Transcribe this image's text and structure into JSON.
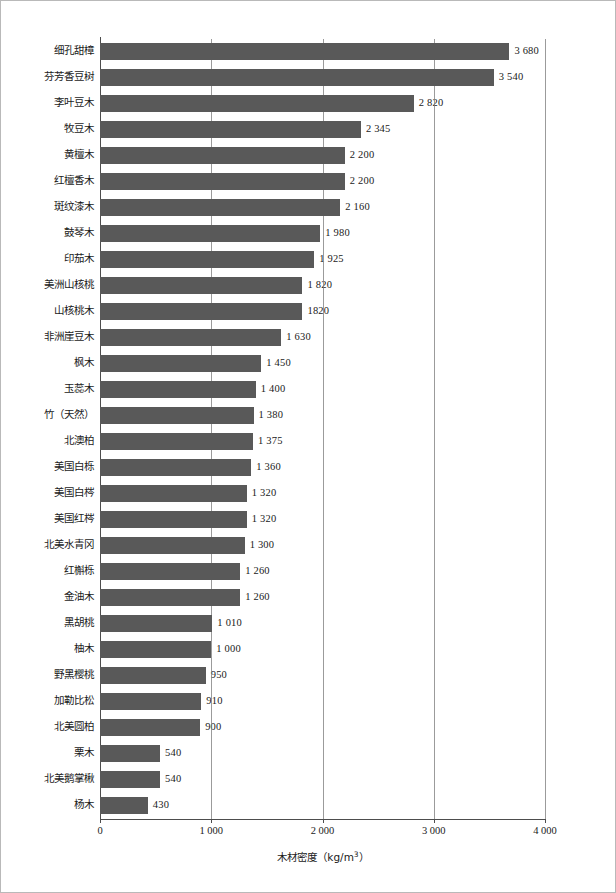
{
  "chart_data": {
    "type": "bar",
    "orientation": "horizontal",
    "title": "",
    "xlabel": "木材密度（kg/m³）",
    "ylabel": "",
    "xlim": [
      0,
      4000
    ],
    "grid": true,
    "legend": null,
    "xticks": [
      "0",
      "1 000",
      "2 000",
      "3 000",
      "4 000"
    ],
    "xtick_values": [
      0,
      1000,
      2000,
      3000,
      4000
    ],
    "bar_color": "#595959",
    "categories": [
      "细孔甜樟",
      "芬芳香豆树",
      "李叶豆木",
      "牧豆木",
      "黄檀木",
      "红檀香木",
      "斑纹漆木",
      "鼓琴木",
      "印茄木",
      "美洲山核桃",
      "山核桃木",
      "非洲崖豆木",
      "枫木",
      "玉蕊木",
      "竹（天然）",
      "北澳柏",
      "美国白栎",
      "美国白梣",
      "美国红梣",
      "北美水青冈",
      "红槲栎",
      "金油木",
      "黑胡桃",
      "柚木",
      "野黑樱桃",
      "加勒比松",
      "北美圆柏",
      "栗木",
      "北美鹅掌楸",
      "杨木"
    ],
    "values": [
      3680,
      3540,
      2820,
      2345,
      2200,
      2200,
      2160,
      1980,
      1925,
      1820,
      1820,
      1630,
      1450,
      1400,
      1380,
      1375,
      1360,
      1320,
      1320,
      1300,
      1260,
      1260,
      1010,
      1000,
      950,
      910,
      900,
      540,
      540,
      430
    ],
    "value_labels": [
      "3 680",
      "3 540",
      "2 820",
      "2 345",
      "2 200",
      "2 200",
      "2 160",
      "1 980",
      "1 925",
      "1 820",
      "1820",
      "1 630",
      "1 450",
      "1 400",
      "1 380",
      "1 375",
      "1 360",
      "1 320",
      "1 320",
      "1 300",
      "1 260",
      "1 260",
      "1 010",
      "1 000",
      "950",
      "910",
      "900",
      "540",
      "540",
      "430"
    ]
  }
}
